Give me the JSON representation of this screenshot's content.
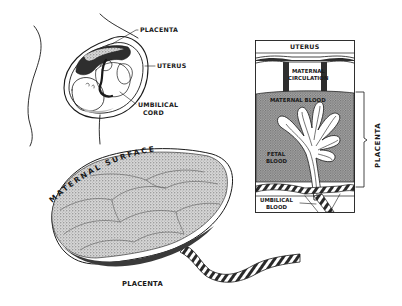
{
  "diagram": {
    "colors": {
      "ink": "#1a1a1a",
      "background": "#ffffff",
      "stipple": "#9a9a9a",
      "dark_fill": "#3a3a3a"
    },
    "fetus_in_womb": {
      "labels": {
        "placenta": "PLACENTA",
        "uterus": "UTERUS",
        "umbilical_cord_line1": "UMBILICAL",
        "umbilical_cord_line2": "CORD"
      }
    },
    "cross_section": {
      "labels": {
        "uterus": "UTERUS",
        "maternal_circulation_line1": "MATERNAL",
        "maternal_circulation_line2": "CIRCULATION",
        "maternal_blood": "MATERNAL  BLOOD",
        "fetal_blood_line1": "FETAL",
        "fetal_blood_line2": "BLOOD",
        "umbilical_blood_line1": "UMBILICAL",
        "umbilical_blood_line2": "BLOOD"
      },
      "bracket_label": "PLACENTA"
    },
    "placenta_organ": {
      "arc_label": "MATERNAL SURFACE",
      "caption": "PLACENTA"
    }
  }
}
